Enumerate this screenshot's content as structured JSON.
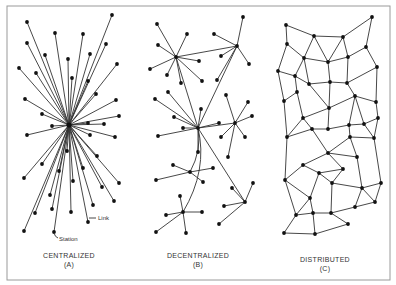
{
  "diagram": {
    "frame": {
      "x": 7,
      "y": 6,
      "w": 383,
      "h": 274
    },
    "panels": [
      {
        "id": "A",
        "title": "CENTRALIZED",
        "letter": "(A)",
        "label_x": 69,
        "hub": [
          69,
          125
        ],
        "leaves": [
          [
            112,
            15
          ],
          [
            27,
            22
          ],
          [
            55,
            33
          ],
          [
            83,
            34
          ],
          [
            27,
            43
          ],
          [
            106,
            44
          ],
          [
            45,
            55
          ],
          [
            90,
            54
          ],
          [
            68,
            59
          ],
          [
            117,
            64
          ],
          [
            19,
            68
          ],
          [
            36,
            73
          ],
          [
            72,
            78
          ],
          [
            88,
            81
          ],
          [
            96,
            94
          ],
          [
            25,
            99
          ],
          [
            116,
            100
          ],
          [
            42,
            114
          ],
          [
            119,
            116
          ],
          [
            52,
            126
          ],
          [
            88,
            123
          ],
          [
            104,
            124
          ],
          [
            27,
            135
          ],
          [
            90,
            135
          ],
          [
            115,
            137
          ],
          [
            67,
            151
          ],
          [
            97,
            156
          ],
          [
            42,
            164
          ],
          [
            83,
            168
          ],
          [
            59,
            171
          ],
          [
            24,
            178
          ],
          [
            73,
            181
          ],
          [
            119,
            183
          ],
          [
            102,
            187
          ],
          [
            50,
            195
          ],
          [
            114,
            201
          ],
          [
            93,
            205
          ],
          [
            52,
            209
          ],
          [
            71,
            212
          ],
          [
            35,
            213
          ],
          [
            88,
            222
          ],
          [
            24,
            231
          ],
          [
            54,
            232
          ]
        ],
        "annotations": [
          {
            "text": "Link",
            "x": 98,
            "y": 220,
            "lx1": 89,
            "ly1": 218,
            "lx2": 96,
            "ly2": 218
          },
          {
            "text": "Station",
            "x": 57,
            "y": 240,
            "lx1": 54,
            "ly1": 233,
            "lx2": 58,
            "ly2": 237
          }
        ]
      },
      {
        "id": "B",
        "title": "DECENTRALIZED",
        "letter": "(B)",
        "label_x": 198,
        "nodes": {
          "h1": [
            176,
            57
          ],
          "h2": [
            237,
            46
          ],
          "h3": [
            198,
            128
          ],
          "h4": [
            235,
            123
          ],
          "h5": [
            190,
            172
          ],
          "h6": [
            245,
            202
          ],
          "h7": [
            183,
            212
          ],
          "a1": [
            157,
            24
          ],
          "a2": [
            187,
            34
          ],
          "a3": [
            158,
            45
          ],
          "a4": [
            199,
            61
          ],
          "a5": [
            150,
            69
          ],
          "a6": [
            167,
            75
          ],
          "a7": [
            181,
            83
          ],
          "a8": [
            202,
            81
          ],
          "b1": [
            243,
            17
          ],
          "b2": [
            214,
            34
          ],
          "b3": [
            221,
            56
          ],
          "b4": [
            249,
            64
          ],
          "b5": [
            217,
            80
          ],
          "c1": [
            201,
            109
          ],
          "c2": [
            174,
            117
          ],
          "c3": [
            183,
            128
          ],
          "c4": [
            158,
            136
          ],
          "c5": [
            198,
            152
          ],
          "c6": [
            168,
            92
          ],
          "c7": [
            155,
            99
          ],
          "c8": [
            219,
            123
          ],
          "d1": [
            252,
            116
          ],
          "d2": [
            221,
            137
          ],
          "d3": [
            245,
            137
          ],
          "d4": [
            228,
            157
          ],
          "d5": [
            226,
            95
          ],
          "d6": [
            248,
            102
          ],
          "e1": [
            173,
            165
          ],
          "e2": [
            213,
            168
          ],
          "e3": [
            156,
            180
          ],
          "e4": [
            203,
            182
          ],
          "f1": [
            232,
            188
          ],
          "f2": [
            253,
            183
          ],
          "f3": [
            224,
            206
          ],
          "f4": [
            219,
            224
          ],
          "g1": [
            180,
            196
          ],
          "g2": [
            202,
            212
          ],
          "g3": [
            166,
            215
          ],
          "g4": [
            156,
            232
          ],
          "g5": [
            186,
            233
          ]
        },
        "edges": [
          [
            "h1",
            "a1"
          ],
          [
            "h1",
            "a2"
          ],
          [
            "h1",
            "a3"
          ],
          [
            "h1",
            "a4"
          ],
          [
            "h1",
            "a5"
          ],
          [
            "h1",
            "a6"
          ],
          [
            "h1",
            "a7"
          ],
          [
            "h1",
            "a8"
          ],
          [
            "h1",
            "h2"
          ],
          [
            "h2",
            "b1"
          ],
          [
            "h2",
            "b2"
          ],
          [
            "h2",
            "b3"
          ],
          [
            "h2",
            "b4"
          ],
          [
            "h2",
            "b5"
          ],
          [
            "h1",
            "h3"
          ],
          [
            "h2",
            "h3"
          ],
          [
            "h3",
            "c1"
          ],
          [
            "h3",
            "c2"
          ],
          [
            "h3",
            "c3"
          ],
          [
            "h3",
            "c4"
          ],
          [
            "h3",
            "c5"
          ],
          [
            "h3",
            "c6"
          ],
          [
            "h3",
            "c7"
          ],
          [
            "h3",
            "c8"
          ],
          [
            "h3",
            "h4"
          ],
          [
            "h4",
            "d1"
          ],
          [
            "h4",
            "d2"
          ],
          [
            "h4",
            "d3"
          ],
          [
            "h4",
            "d4"
          ],
          [
            "h4",
            "d5"
          ],
          [
            "h4",
            "d6"
          ],
          [
            "h5",
            "e1"
          ],
          [
            "h5",
            "e2"
          ],
          [
            "h5",
            "e3"
          ],
          [
            "h5",
            "e4"
          ],
          [
            "h3",
            "h6"
          ],
          [
            "h6",
            "f1"
          ],
          [
            "h6",
            "f2"
          ],
          [
            "h6",
            "f3"
          ],
          [
            "h6",
            "f4"
          ],
          [
            "h7",
            "g1"
          ],
          [
            "h7",
            "g2"
          ],
          [
            "h7",
            "g3"
          ],
          [
            "h7",
            "g4"
          ],
          [
            "h7",
            "g5"
          ]
        ],
        "curves": [
          {
            "from": "h3",
            "to": "h5",
            "cx": 202,
            "cy": 150
          },
          {
            "from": "h3",
            "to": "h7",
            "cx": 208,
            "cy": 170
          }
        ]
      },
      {
        "id": "C",
        "title": "DISTRIBUTED",
        "letter": "(C)",
        "label_x": 325,
        "nodes": {
          "a": [
            286,
            25
          ],
          "b": [
            314,
            36
          ],
          "c": [
            343,
            37
          ],
          "d": [
            372,
            17
          ],
          "e": [
            287,
            44
          ],
          "f": [
            366,
            47
          ],
          "g": [
            304,
            58
          ],
          "h": [
            328,
            62
          ],
          "i": [
            348,
            57
          ],
          "j": [
            377,
            67
          ],
          "k": [
            278,
            71
          ],
          "l": [
            295,
            76
          ],
          "m": [
            309,
            84
          ],
          "n": [
            330,
            82
          ],
          "o": [
            347,
            83
          ],
          "p": [
            297,
            92
          ],
          "q": [
            355,
            96
          ],
          "r": [
            284,
            101
          ],
          "s": [
            376,
            102
          ],
          "t": [
            329,
            108
          ],
          "u": [
            303,
            118
          ],
          "v": [
            378,
            118
          ],
          "w": [
            312,
            129
          ],
          "x": [
            328,
            129
          ],
          "y": [
            349,
            125
          ],
          "z": [
            364,
            124
          ],
          "A": [
            287,
            137
          ],
          "B": [
            350,
            137
          ],
          "C": [
            374,
            138
          ],
          "D": [
            328,
            153
          ],
          "E": [
            357,
            157
          ],
          "F": [
            303,
            165
          ],
          "G": [
            343,
            169
          ],
          "H": [
            319,
            173
          ],
          "I": [
            285,
            180
          ],
          "J": [
            332,
            183
          ],
          "K": [
            381,
            183
          ],
          "L": [
            362,
            188
          ],
          "M": [
            310,
            198
          ],
          "N": [
            375,
            202
          ],
          "O": [
            355,
            207
          ],
          "P": [
            296,
            215
          ],
          "Q": [
            313,
            213
          ],
          "R": [
            331,
            213
          ],
          "S": [
            348,
            224
          ],
          "T": [
            284,
            233
          ],
          "U": [
            315,
            234
          ]
        },
        "edges": [
          [
            "a",
            "b"
          ],
          [
            "b",
            "c"
          ],
          [
            "c",
            "d"
          ],
          [
            "a",
            "e"
          ],
          [
            "e",
            "g"
          ],
          [
            "b",
            "g"
          ],
          [
            "b",
            "h"
          ],
          [
            "c",
            "h"
          ],
          [
            "c",
            "i"
          ],
          [
            "d",
            "f"
          ],
          [
            "f",
            "i"
          ],
          [
            "f",
            "j"
          ],
          [
            "g",
            "h"
          ],
          [
            "h",
            "i"
          ],
          [
            "e",
            "k"
          ],
          [
            "g",
            "l"
          ],
          [
            "k",
            "l"
          ],
          [
            "g",
            "m"
          ],
          [
            "l",
            "m"
          ],
          [
            "h",
            "n"
          ],
          [
            "i",
            "o"
          ],
          [
            "m",
            "n"
          ],
          [
            "n",
            "o"
          ],
          [
            "j",
            "o"
          ],
          [
            "j",
            "s"
          ],
          [
            "l",
            "p"
          ],
          [
            "k",
            "r"
          ],
          [
            "p",
            "r"
          ],
          [
            "p",
            "u"
          ],
          [
            "m",
            "t"
          ],
          [
            "n",
            "t"
          ],
          [
            "o",
            "q"
          ],
          [
            "q",
            "s"
          ],
          [
            "t",
            "q"
          ],
          [
            "t",
            "u"
          ],
          [
            "u",
            "w"
          ],
          [
            "w",
            "x"
          ],
          [
            "x",
            "t"
          ],
          [
            "x",
            "y"
          ],
          [
            "y",
            "q"
          ],
          [
            "q",
            "z"
          ],
          [
            "y",
            "z"
          ],
          [
            "z",
            "v"
          ],
          [
            "v",
            "s"
          ],
          [
            "u",
            "A"
          ],
          [
            "A",
            "r"
          ],
          [
            "A",
            "w"
          ],
          [
            "w",
            "D"
          ],
          [
            "y",
            "B"
          ],
          [
            "B",
            "D"
          ],
          [
            "B",
            "C"
          ],
          [
            "C",
            "v"
          ],
          [
            "C",
            "z"
          ],
          [
            "D",
            "F"
          ],
          [
            "D",
            "G"
          ],
          [
            "D",
            "E"
          ],
          [
            "F",
            "H"
          ],
          [
            "H",
            "G"
          ],
          [
            "F",
            "I"
          ],
          [
            "H",
            "J"
          ],
          [
            "G",
            "J"
          ],
          [
            "E",
            "L"
          ],
          [
            "J",
            "L"
          ],
          [
            "L",
            "K"
          ],
          [
            "K",
            "N"
          ],
          [
            "L",
            "N"
          ],
          [
            "B",
            "E"
          ],
          [
            "A",
            "I"
          ],
          [
            "I",
            "M"
          ],
          [
            "H",
            "M"
          ],
          [
            "M",
            "P"
          ],
          [
            "M",
            "Q"
          ],
          [
            "J",
            "R"
          ],
          [
            "P",
            "Q"
          ],
          [
            "Q",
            "R"
          ],
          [
            "R",
            "O"
          ],
          [
            "O",
            "L"
          ],
          [
            "O",
            "N"
          ],
          [
            "R",
            "S"
          ],
          [
            "P",
            "T"
          ],
          [
            "T",
            "U"
          ],
          [
            "U",
            "S"
          ],
          [
            "Q",
            "U"
          ],
          [
            "I",
            "P"
          ],
          [
            "C",
            "K"
          ]
        ]
      }
    ]
  },
  "labels": {
    "centralized": "CENTRALIZED",
    "centralized_letter": "(A)",
    "decentralized": "DECENTRALIZED",
    "decentralized_letter": "(B)",
    "distributed": "DISTRIBUTED",
    "distributed_letter": "(C)",
    "link": "Link",
    "station": "Station"
  },
  "colors": {
    "line": "#333333",
    "node": "#111111",
    "frame": "#9a9a9a",
    "background": "#ffffff"
  }
}
